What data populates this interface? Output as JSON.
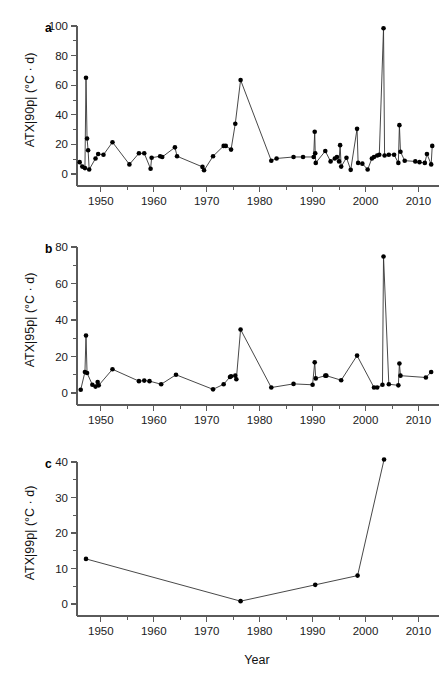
{
  "figure": {
    "width": 447,
    "height": 683,
    "background": "#ffffff",
    "line_color": "#333333",
    "point_color": "#000000",
    "axis_color": "#5a5a5a",
    "xlabel": "Year"
  },
  "chart_data": [
    {
      "id": "panel-a",
      "type": "line",
      "panel_letter": "a",
      "title": "",
      "xlabel": "",
      "ylabel": "ATX|90p| (°C · d)",
      "xlim": [
        1945.5,
        2013.5
      ],
      "ylim": [
        0,
        100
      ],
      "xticks": [
        1950,
        1960,
        1970,
        1980,
        1990,
        2000,
        2010
      ],
      "xticklabels": [
        "1950",
        "1960",
        "1970",
        "1980",
        "1990",
        "2000",
        "2010"
      ],
      "yticks": [
        0,
        20,
        40,
        60,
        80,
        100
      ],
      "yticklabels": [
        "0",
        "20",
        "40",
        "60",
        "80",
        "100"
      ],
      "x_minor_step": 5,
      "y_minor_step": 10,
      "grid": false,
      "legend": false,
      "marker": "circle",
      "x": [
        1946.0,
        1946.5,
        1947.0,
        1947.2,
        1947.4,
        1947.6,
        1947.8,
        1949.0,
        1949.5,
        1950.5,
        1952.2,
        1955.4,
        1957.2,
        1958.2,
        1959.4,
        1959.6,
        1961.2,
        1961.6,
        1964.0,
        1964.4,
        1969.2,
        1969.5,
        1971.2,
        1973.2,
        1973.6,
        1974.6,
        1975.4,
        1976.4,
        1982.2,
        1983.2,
        1986.4,
        1988.2,
        1990.2,
        1990.4,
        1990.5,
        1990.6,
        1992.4,
        1993.4,
        1994.2,
        1994.6,
        1995.0,
        1995.2,
        1995.4,
        1996.4,
        1997.2,
        1998.4,
        1998.6,
        1999.4,
        2000.4,
        2001.2,
        2001.6,
        2002.2,
        2002.6,
        2003.4,
        2003.6,
        2004.4,
        2005.4,
        2006.2,
        2006.4,
        2006.6,
        2007.4,
        2009.4,
        2010.2,
        2011.2,
        2011.6,
        2012.4,
        2012.6
      ],
      "y": [
        8.0,
        5.0,
        4.0,
        65.0,
        24.0,
        16.0,
        3.0,
        10.5,
        13.5,
        13.0,
        21.5,
        6.5,
        14.0,
        14.0,
        3.5,
        11.0,
        12.0,
        11.5,
        18.0,
        12.0,
        4.8,
        2.5,
        12.0,
        19.0,
        19.0,
        16.5,
        34.0,
        63.5,
        9.0,
        10.5,
        11.5,
        11.5,
        11.5,
        28.5,
        14.0,
        7.5,
        15.5,
        8.5,
        10.5,
        11.5,
        8.5,
        19.5,
        5.0,
        11.0,
        2.8,
        30.5,
        7.5,
        7.0,
        3.0,
        10.5,
        11.5,
        12.5,
        13.0,
        98.5,
        12.5,
        13.0,
        13.0,
        7.5,
        33.0,
        15.0,
        9.0,
        8.5,
        8.0,
        7.5,
        13.5,
        6.5,
        19.0
      ]
    },
    {
      "id": "panel-b",
      "type": "line",
      "panel_letter": "b",
      "title": "",
      "xlabel": "",
      "ylabel": "ATX|95p| (°C · d)",
      "xlim": [
        1945.5,
        2013.5
      ],
      "ylim": [
        0,
        80
      ],
      "xticks": [
        1950,
        1960,
        1970,
        1980,
        1990,
        2000,
        2010
      ],
      "xticklabels": [
        "1950",
        "1960",
        "1970",
        "1980",
        "1990",
        "2000",
        "2010"
      ],
      "yticks": [
        0,
        20,
        40,
        60,
        80
      ],
      "yticklabels": [
        "0",
        "20",
        "40",
        "60",
        "80"
      ],
      "x_minor_step": 5,
      "y_minor_step": 10,
      "grid": false,
      "legend": false,
      "marker": "circle",
      "x": [
        1946.2,
        1947.0,
        1947.2,
        1947.4,
        1948.4,
        1949.0,
        1949.4,
        1949.6,
        1952.2,
        1957.2,
        1958.2,
        1959.2,
        1961.4,
        1964.2,
        1971.2,
        1973.2,
        1974.4,
        1974.6,
        1975.4,
        1975.6,
        1976.4,
        1982.2,
        1986.4,
        1990.0,
        1990.4,
        1990.6,
        1992.4,
        1992.6,
        1995.4,
        1998.4,
        2001.6,
        2002.2,
        2003.2,
        2003.4,
        2004.4,
        2006.2,
        2006.4,
        2006.6,
        2011.4,
        2012.4
      ],
      "y": [
        1.8,
        11.5,
        31.5,
        11.0,
        4.5,
        3.5,
        6.0,
        4.2,
        13.0,
        6.5,
        6.8,
        6.5,
        4.8,
        10.0,
        2.0,
        4.8,
        8.8,
        9.2,
        9.5,
        7.5,
        34.8,
        3.0,
        5.0,
        4.5,
        16.8,
        8.0,
        9.5,
        9.5,
        7.0,
        20.5,
        3.0,
        3.0,
        4.5,
        74.8,
        4.8,
        4.2,
        16.2,
        9.5,
        8.5,
        11.5
      ]
    },
    {
      "id": "panel-c",
      "type": "line",
      "panel_letter": "c",
      "title": "",
      "xlabel": "Year",
      "ylabel": "ATX|99p| (°C · d)",
      "xlim": [
        1945.5,
        2013.5
      ],
      "ylim": [
        0,
        40
      ],
      "xticks": [
        1950,
        1960,
        1970,
        1980,
        1990,
        2000,
        2010
      ],
      "xticklabels": [
        "1950",
        "1960",
        "1970",
        "1980",
        "1990",
        "2000",
        "2010"
      ],
      "yticks": [
        0,
        10,
        20,
        30,
        40
      ],
      "yticklabels": [
        "0",
        "10",
        "20",
        "30",
        "40"
      ],
      "x_minor_step": 5,
      "y_minor_step": 5,
      "grid": false,
      "legend": false,
      "marker": "circle",
      "x": [
        1947.2,
        1976.4,
        1990.5,
        1998.5,
        2003.5
      ],
      "y": [
        12.7,
        0.8,
        5.4,
        8.0,
        40.7
      ]
    }
  ]
}
